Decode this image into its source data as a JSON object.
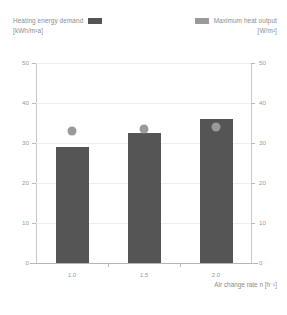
{
  "legend": {
    "left": {
      "label": "Heating energy demand",
      "unit": "[kWh/m²a]",
      "color": "#555555",
      "swatch_icon": "filled-square-dark"
    },
    "right": {
      "label": "Maximum heat output",
      "unit": "[W/m²]",
      "color": "#9a9a9a",
      "swatch_icon": "filled-square-light"
    }
  },
  "axes": {
    "x_title": "Air change rate n  [h⁻¹]",
    "left_ticks": [
      "0",
      "10",
      "20",
      "30",
      "40",
      "50"
    ],
    "right_ticks": [
      "0",
      "10",
      "20",
      "30",
      "40",
      "50"
    ],
    "x_ticks": [
      "1.0",
      "1.5",
      "2.0"
    ]
  },
  "chart_data": {
    "type": "bar",
    "title": "",
    "subtitle": "",
    "xlabel": "Air change rate n [h⁻¹]",
    "ylabel": "Heating energy demand [kWh/m²a]",
    "y2label": "Maximum heat output [W/m²]",
    "categories": [
      "1.0",
      "1.5",
      "2.0"
    ],
    "ylim": [
      0,
      50
    ],
    "y2lim": [
      0,
      50
    ],
    "yticks": [
      0,
      10,
      20,
      30,
      40,
      50
    ],
    "y2ticks": [
      0,
      10,
      20,
      30,
      40,
      50
    ],
    "grid": true,
    "legend_position": "top",
    "series": [
      {
        "name": "Heating energy demand",
        "unit": "kWh/m²a",
        "type": "bar",
        "axis": "left",
        "color": "#555555",
        "values": [
          29,
          32.5,
          36
        ]
      },
      {
        "name": "Maximum heat output",
        "unit": "W/m²",
        "type": "scatter",
        "axis": "right",
        "color": "#9a9a9a",
        "marker": "circle",
        "values": [
          33,
          33.5,
          34
        ]
      }
    ]
  }
}
